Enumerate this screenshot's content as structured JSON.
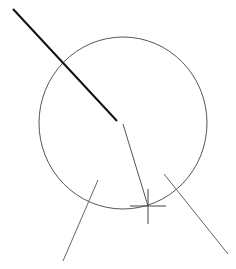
{
  "canvas": {
    "width": 236,
    "height": 269,
    "background": "#ffffff"
  },
  "entities": {
    "circle": {
      "cx": 123,
      "cy": 123,
      "rx": 84,
      "ry": 86,
      "stroke": "#555555",
      "stroke_width": 1
    },
    "rubber_band_line": {
      "x1": 13,
      "y1": 9,
      "x2": 117,
      "y2": 121,
      "stroke": "#111111",
      "stroke_width": 2
    },
    "radius_line": {
      "x1": 123,
      "y1": 124,
      "x2": 148,
      "y2": 206,
      "stroke": "#555555",
      "stroke_width": 1
    },
    "line_bottom_left": {
      "x1": 98,
      "y1": 180,
      "x2": 63,
      "y2": 261,
      "stroke": "#666666",
      "stroke_width": 1
    },
    "line_bottom_right": {
      "x1": 164,
      "y1": 174,
      "x2": 228,
      "y2": 254,
      "stroke": "#666666",
      "stroke_width": 1
    }
  },
  "cursor": {
    "type": "crosshair-icon",
    "x": 148,
    "y": 206,
    "h_left": 130,
    "h_right": 166,
    "v_top": 189,
    "v_bottom": 224,
    "stroke": "#444444"
  }
}
